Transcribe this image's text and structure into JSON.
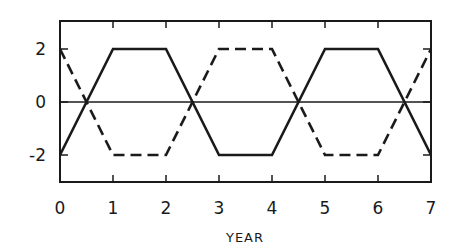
{
  "chart_data": {
    "type": "line",
    "title": "",
    "xlabel": "YEAR",
    "ylabel": "",
    "xlim": [
      0,
      7
    ],
    "ylim": [
      -3,
      3
    ],
    "x_ticks": [
      0,
      1,
      2,
      3,
      4,
      5,
      6,
      7
    ],
    "x_tick_labels": [
      "0",
      "1",
      "2",
      "3",
      "4",
      "5",
      "6",
      "7"
    ],
    "y_ticks": [
      2,
      0,
      -2
    ],
    "y_tick_labels": [
      "2",
      "0",
      "-2"
    ],
    "grid": false,
    "legend": null,
    "reference_lines": [
      {
        "y": 0,
        "style": "solid-thin"
      }
    ],
    "series": [
      {
        "name": "solid",
        "style": "solid",
        "x": [
          0,
          1,
          2,
          3,
          4,
          5,
          6,
          7
        ],
        "y": [
          -2,
          2,
          2,
          -2,
          -2,
          2,
          2,
          -2
        ]
      },
      {
        "name": "dashed",
        "style": "dashed",
        "x": [
          0,
          1,
          2,
          3,
          4,
          5,
          6,
          7
        ],
        "y": [
          2,
          -2,
          -2,
          2,
          2,
          -2,
          -2,
          2
        ]
      }
    ]
  },
  "colors": {
    "line": "#1a1a1a",
    "background": "#ffffff"
  }
}
